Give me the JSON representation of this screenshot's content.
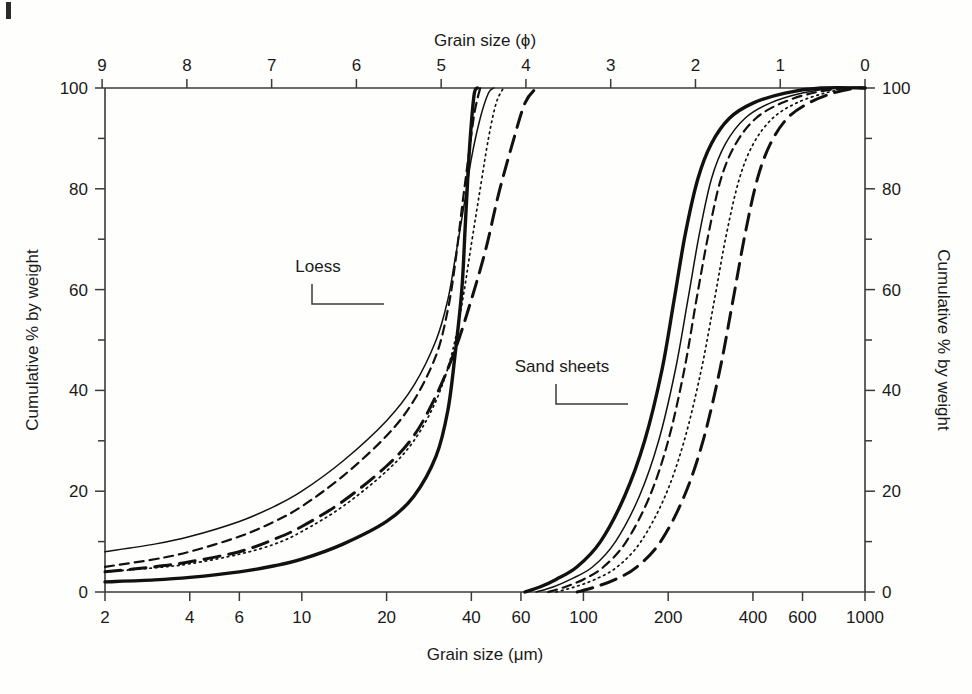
{
  "figure": {
    "background_color": "#fefefc",
    "ink_color": "#111111",
    "corner_mark": "page-edge-mark"
  },
  "chart_data": {
    "type": "line",
    "title": "",
    "xlabel": "Grain size (μm)",
    "ylabel": "Cumulative % by weight",
    "top_axis_label": "Grain size (ϕ)",
    "right_axis_label": "Cumulative % by weight",
    "xscale": "log",
    "xlim": [
      2,
      1000
    ],
    "ylim": [
      0,
      100
    ],
    "grid": false,
    "legend": "none",
    "x_ticks_um": [
      2,
      4,
      6,
      10,
      20,
      40,
      60,
      100,
      200,
      400,
      600,
      1000
    ],
    "x_tick_labels_um": [
      "2",
      "4",
      "6",
      "10",
      "20",
      "40",
      "60",
      "100",
      "200",
      "400",
      "600",
      "1000"
    ],
    "x_ticks_phi": [
      9,
      8,
      7,
      6,
      5,
      4,
      3,
      2,
      1,
      0
    ],
    "x_tick_labels_phi": [
      "9",
      "8",
      "7",
      "6",
      "5",
      "4",
      "3",
      "2",
      "1",
      "0"
    ],
    "y_ticks_major": [
      0,
      20,
      40,
      60,
      80,
      100
    ],
    "y_tick_labels": [
      "0",
      "20",
      "40",
      "60",
      "80",
      "100"
    ],
    "y_ticks_minor": [
      10,
      30,
      50,
      70,
      90
    ],
    "annotations": [
      {
        "text": "Loess",
        "x_px": 318,
        "y_px": 272,
        "leader": "elbow-right"
      },
      {
        "text": "Sand sheets",
        "x_px": 562,
        "y_px": 372,
        "leader": "elbow-right"
      }
    ],
    "groups": [
      {
        "name": "Loess",
        "series": [
          {
            "name": "loess-1-thin-solid",
            "style": "solid-thin",
            "points": [
              [
                2,
                8
              ],
              [
                3,
                9.5
              ],
              [
                4,
                11
              ],
              [
                6,
                14
              ],
              [
                8,
                17
              ],
              [
                10,
                20
              ],
              [
                14,
                26
              ],
              [
                20,
                34
              ],
              [
                25,
                41
              ],
              [
                30,
                50
              ],
              [
                33,
                58
              ],
              [
                35,
                66
              ],
              [
                38,
                78
              ],
              [
                40,
                86
              ],
              [
                43,
                94
              ],
              [
                46,
                99
              ],
              [
                48,
                100
              ]
            ]
          },
          {
            "name": "loess-2-dashed",
            "style": "dashed",
            "points": [
              [
                2,
                5
              ],
              [
                3,
                6.5
              ],
              [
                4,
                8
              ],
              [
                6,
                11
              ],
              [
                8,
                14
              ],
              [
                10,
                17
              ],
              [
                14,
                23
              ],
              [
                20,
                31
              ],
              [
                25,
                38
              ],
              [
                30,
                47
              ],
              [
                33,
                56
              ],
              [
                35,
                65
              ],
              [
                37,
                76
              ],
              [
                39,
                86
              ],
              [
                41,
                95
              ],
              [
                43,
                100
              ]
            ]
          },
          {
            "name": "loess-3-long-dashed",
            "style": "long-dashed",
            "points": [
              [
                2,
                4
              ],
              [
                3,
                5
              ],
              [
                4,
                6
              ],
              [
                6,
                8
              ],
              [
                8,
                10.5
              ],
              [
                10,
                13
              ],
              [
                14,
                18
              ],
              [
                20,
                25
              ],
              [
                25,
                31
              ],
              [
                30,
                39
              ],
              [
                35,
                48
              ],
              [
                40,
                58
              ],
              [
                45,
                68
              ],
              [
                50,
                79
              ],
              [
                56,
                89
              ],
              [
                62,
                97
              ],
              [
                68,
                100
              ]
            ]
          },
          {
            "name": "loess-4-dotted",
            "style": "dotted",
            "points": [
              [
                2,
                4
              ],
              [
                3,
                4.8
              ],
              [
                4,
                5.6
              ],
              [
                6,
                7.5
              ],
              [
                8,
                9.5
              ],
              [
                10,
                12
              ],
              [
                14,
                17
              ],
              [
                20,
                24
              ],
              [
                25,
                30
              ],
              [
                30,
                38
              ],
              [
                34,
                47
              ],
              [
                37,
                57
              ],
              [
                40,
                69
              ],
              [
                43,
                80
              ],
              [
                46,
                90
              ],
              [
                49,
                97
              ],
              [
                52,
                100
              ]
            ]
          },
          {
            "name": "loess-5-thick-solid",
            "style": "solid-thick",
            "points": [
              [
                2,
                2
              ],
              [
                3,
                2.4
              ],
              [
                4,
                2.9
              ],
              [
                6,
                4
              ],
              [
                8,
                5.2
              ],
              [
                10,
                6.5
              ],
              [
                14,
                9.5
              ],
              [
                20,
                14
              ],
              [
                25,
                19
              ],
              [
                30,
                27
              ],
              [
                33,
                36
              ],
              [
                35,
                47
              ],
              [
                37,
                60
              ],
              [
                38,
                72
              ],
              [
                39,
                84
              ],
              [
                40,
                93
              ],
              [
                41,
                99
              ],
              [
                42,
                100
              ]
            ]
          }
        ]
      },
      {
        "name": "Sand sheets",
        "series": [
          {
            "name": "sand-1-thick-solid",
            "style": "solid-thick",
            "points": [
              [
                62,
                0
              ],
              [
                70,
                1
              ],
              [
                80,
                2.5
              ],
              [
                95,
                5
              ],
              [
                115,
                10
              ],
              [
                140,
                19
              ],
              [
                165,
                30
              ],
              [
                190,
                44
              ],
              [
                210,
                58
              ],
              [
                230,
                71
              ],
              [
                255,
                82
              ],
              [
                285,
                89
              ],
              [
                330,
                94
              ],
              [
                400,
                97
              ],
              [
                520,
                99
              ],
              [
                700,
                100
              ],
              [
                1000,
                100
              ]
            ]
          },
          {
            "name": "sand-2-thin-solid",
            "style": "solid-thin",
            "points": [
              [
                68,
                0
              ],
              [
                78,
                1
              ],
              [
                90,
                2.5
              ],
              [
                108,
                5
              ],
              [
                130,
                10
              ],
              [
                158,
                19
              ],
              [
                185,
                30
              ],
              [
                212,
                44
              ],
              [
                235,
                58
              ],
              [
                258,
                71
              ],
              [
                285,
                82
              ],
              [
                320,
                89
              ],
              [
                375,
                94
              ],
              [
                460,
                97
              ],
              [
                600,
                99
              ],
              [
                800,
                100
              ],
              [
                1000,
                100
              ]
            ]
          },
          {
            "name": "sand-3-dashed",
            "style": "dashed",
            "points": [
              [
                75,
                0
              ],
              [
                86,
                1
              ],
              [
                100,
                2.5
              ],
              [
                118,
                5
              ],
              [
                142,
                10
              ],
              [
                172,
                19
              ],
              [
                200,
                30
              ],
              [
                228,
                44
              ],
              [
                252,
                58
              ],
              [
                278,
                71
              ],
              [
                308,
                82
              ],
              [
                348,
                89
              ],
              [
                410,
                94
              ],
              [
                505,
                97
              ],
              [
                650,
                99
              ],
              [
                850,
                100
              ],
              [
                1000,
                100
              ]
            ]
          },
          {
            "name": "sand-4-dotted",
            "style": "dotted",
            "points": [
              [
                80,
                0
              ],
              [
                93,
                1
              ],
              [
                110,
                2.5
              ],
              [
                132,
                5
              ],
              [
                160,
                10
              ],
              [
                195,
                19
              ],
              [
                228,
                30
              ],
              [
                262,
                44
              ],
              [
                292,
                58
              ],
              [
                322,
                71
              ],
              [
                358,
                82
              ],
              [
                402,
                89
              ],
              [
                470,
                94
              ],
              [
                570,
                97
              ],
              [
                720,
                99
              ],
              [
                900,
                100
              ],
              [
                1000,
                100
              ]
            ]
          },
          {
            "name": "sand-5-long-dashed",
            "style": "long-dashed",
            "points": [
              [
                95,
                0
              ],
              [
                110,
                1
              ],
              [
                130,
                2.5
              ],
              [
                155,
                5
              ],
              [
                188,
                10
              ],
              [
                228,
                19
              ],
              [
                266,
                30
              ],
              [
                305,
                44
              ],
              [
                340,
                58
              ],
              [
                375,
                71
              ],
              [
                415,
                82
              ],
              [
                462,
                89
              ],
              [
                530,
                94
              ],
              [
                630,
                97
              ],
              [
                770,
                99
              ],
              [
                930,
                100
              ],
              [
                1000,
                100
              ]
            ]
          }
        ]
      }
    ]
  }
}
